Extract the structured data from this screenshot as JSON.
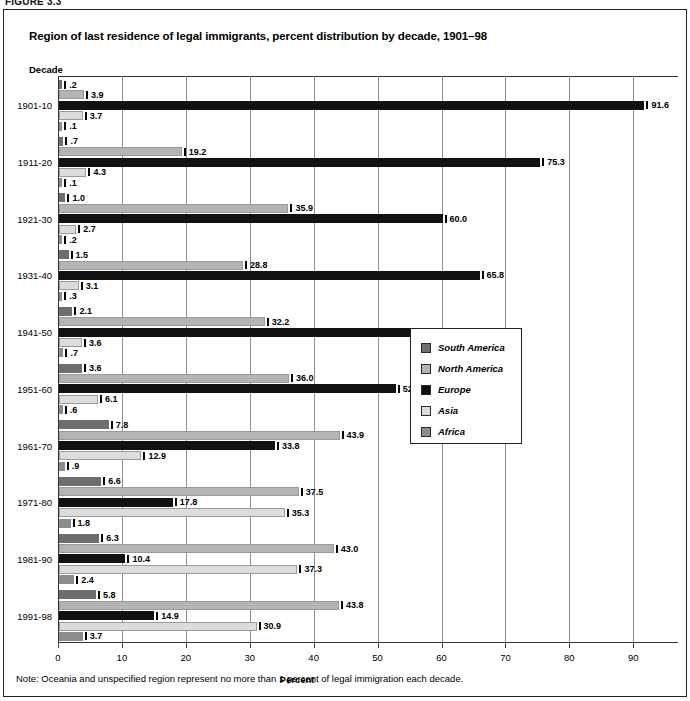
{
  "figure_number": "FIGURE 3.3",
  "title": "Region of last residence of legal immigrants, percent distribution by decade, 1901–98",
  "y_axis_title": "Decade",
  "x_axis_label": "Percent",
  "note": "Note: Oceania and unspecified region represent no more than 1 percent of legal immigration each decade.",
  "colors": {
    "south_america": "#6e6e6e",
    "north_america": "#b4b4b4",
    "europe": "#111111",
    "asia": "#dcdcdc",
    "africa": "#8c8c8c",
    "gridline": "#8d8d8d",
    "axis": "#333333"
  },
  "legend": {
    "position": "center-right",
    "items": [
      {
        "label": "South America",
        "color": "#6e6e6e"
      },
      {
        "label": "North America",
        "color": "#b4b4b4"
      },
      {
        "label": "Europe",
        "color": "#111111"
      },
      {
        "label": "Asia",
        "color": "#dcdcdc"
      },
      {
        "label": "Africa",
        "color": "#8c8c8c"
      }
    ]
  },
  "chart_data": {
    "type": "bar",
    "orientation": "horizontal",
    "title": "Region of last residence of legal immigrants, percent distribution by decade, 1901–98",
    "xlabel": "Percent",
    "ylabel": "Decade",
    "xlim": [
      0,
      97
    ],
    "xticks": [
      0,
      10,
      20,
      30,
      40,
      50,
      60,
      70,
      80,
      90
    ],
    "grid": true,
    "categories": [
      "1901-10",
      "1911-20",
      "1921-30",
      "1931-40",
      "1941-50",
      "1951-60",
      "1961-70",
      "1971-80",
      "1981-90",
      "1991-98"
    ],
    "series": [
      {
        "name": "South America",
        "color": "#6e6e6e",
        "values": [
          0.2,
          0.7,
          1.0,
          1.5,
          2.1,
          3.6,
          7.8,
          6.6,
          6.3,
          5.8
        ],
        "labels": [
          ".2",
          ".7",
          "1.0",
          "1.5",
          "2.1",
          "3.6",
          "7.8",
          "6.6",
          "6.3",
          "5.8"
        ]
      },
      {
        "name": "North America",
        "color": "#b4b4b4",
        "values": [
          3.9,
          19.2,
          35.9,
          28.8,
          32.2,
          36.0,
          43.9,
          37.5,
          43.0,
          43.8
        ],
        "labels": [
          "3.9",
          "19.2",
          "35.9",
          "28.8",
          "32.2",
          "36.0",
          "43.9",
          "37.5",
          "43.0",
          "43.8"
        ]
      },
      {
        "name": "Europe",
        "color": "#111111",
        "values": [
          91.6,
          75.3,
          60.0,
          65.8,
          60.0,
          52.7,
          33.8,
          17.8,
          10.4,
          14.9
        ],
        "labels": [
          "91.6",
          "75.3",
          "60.0",
          "65.8",
          "60.0",
          "52.7",
          "33.8",
          "17.8",
          "10.4",
          "14.9"
        ]
      },
      {
        "name": "Asia",
        "color": "#dcdcdc",
        "values": [
          3.7,
          4.3,
          2.7,
          3.1,
          3.6,
          6.1,
          12.9,
          35.3,
          37.3,
          30.9
        ],
        "labels": [
          "3.7",
          "4.3",
          "2.7",
          "3.1",
          "3.6",
          "6.1",
          "12.9",
          "35.3",
          "37.3",
          "30.9"
        ]
      },
      {
        "name": "Africa",
        "color": "#8c8c8c",
        "values": [
          0.1,
          0.1,
          0.2,
          0.3,
          0.7,
          0.6,
          0.9,
          1.8,
          2.4,
          3.7
        ],
        "labels": [
          ".1",
          ".1",
          ".2",
          ".3",
          ".7",
          ".6",
          ".9",
          "1.8",
          "2.4",
          "3.7"
        ]
      }
    ]
  }
}
